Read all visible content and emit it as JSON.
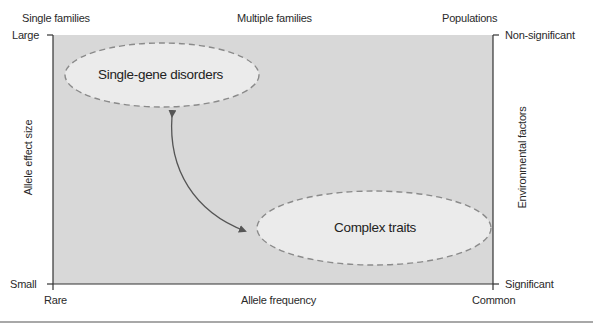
{
  "diagram": {
    "top_labels": {
      "left": "Single families",
      "center": "Multiple families",
      "right": "Populations"
    },
    "left_axis": {
      "title": "Allele effect size",
      "top": "Large",
      "bottom": "Small"
    },
    "right_axis": {
      "title": "Environmental factors",
      "top": "Non-significant",
      "bottom": "Significant"
    },
    "bottom_axis": {
      "title": "Allele frequency",
      "left": "Rare",
      "right": "Common"
    },
    "nodes": [
      {
        "label": "Single-gene disorders",
        "position": "upper-left"
      },
      {
        "label": "Complex traits",
        "position": "lower-right"
      }
    ],
    "connector": {
      "type": "double-headed curved arrow",
      "from": "Single-gene disorders",
      "to": "Complex traits"
    },
    "colors": {
      "plot_background": "#d8d8d8",
      "ellipse_fill": "#ebebeb",
      "ellipse_stroke": "#8a8a8a",
      "axis_line": "#333333",
      "arrow": "#555555"
    }
  }
}
